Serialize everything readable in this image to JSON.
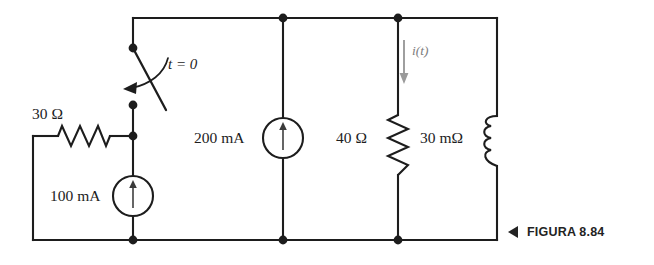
{
  "figure": {
    "caption_label": "FIGURA 8.84",
    "caption_marker_icon": "left-triangle-icon",
    "background_color": "#ffffff",
    "wire_color": "#1d1d1d",
    "current_arrow_color": "#8c8c8c"
  },
  "components": {
    "resistor_30ohm": {
      "label": "30 Ω",
      "value": 30,
      "unit": "Ω",
      "orientation": "horizontal"
    },
    "source_100ma": {
      "label": "100 mA",
      "value": 100,
      "unit": "mA",
      "type": "current-source",
      "arrow_direction": "up"
    },
    "source_200ma": {
      "label": "200 mA",
      "value": 200,
      "unit": "mA",
      "type": "current-source",
      "arrow_direction": "up"
    },
    "resistor_40ohm": {
      "label": "40 Ω",
      "value": 40,
      "unit": "Ω",
      "orientation": "vertical"
    },
    "inductor_30mohm": {
      "label": "30 mΩ",
      "value": 30,
      "unit": "mΩ",
      "type": "inductor",
      "orientation": "vertical"
    },
    "switch": {
      "label": "t = 0",
      "type": "spst-switch",
      "state": "open"
    },
    "current_it": {
      "label": "i(t)",
      "arrow_direction": "down"
    }
  }
}
